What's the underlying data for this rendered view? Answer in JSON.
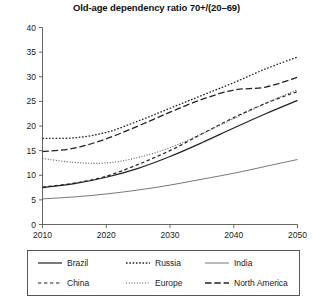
{
  "chart_data": {
    "type": "line",
    "title": "Old-age dependency ratio 70+/(20–69)",
    "xlabel": "",
    "ylabel": "",
    "xlim": [
      2010,
      2050
    ],
    "ylim": [
      0,
      40
    ],
    "xticks": [
      2010,
      2020,
      2030,
      2040,
      2050
    ],
    "yticks": [
      0,
      5,
      10,
      15,
      20,
      25,
      30,
      35,
      40
    ],
    "grid": false,
    "legend_position": "bottom",
    "x": [
      2010,
      2015,
      2020,
      2025,
      2030,
      2035,
      2040,
      2045,
      2050
    ],
    "series": [
      {
        "name": "Brazil",
        "style": "solid",
        "color": "#222222",
        "width": 1.2,
        "values": [
          7.5,
          8.3,
          9.6,
          11.4,
          13.8,
          16.6,
          19.6,
          22.5,
          25.2
        ]
      },
      {
        "name": "Russia",
        "style": "dotted",
        "color": "#222222",
        "width": 1.3,
        "values": [
          17.5,
          17.6,
          18.7,
          21.0,
          23.6,
          26.2,
          28.8,
          31.6,
          34.0
        ]
      },
      {
        "name": "India",
        "style": "solid-thin",
        "color": "#555555",
        "width": 0.8,
        "values": [
          5.2,
          5.6,
          6.2,
          7.0,
          8.0,
          9.2,
          10.4,
          11.8,
          13.2
        ]
      },
      {
        "name": "China",
        "style": "dashed",
        "color": "#222222",
        "width": 1.2,
        "values": [
          7.6,
          8.4,
          9.8,
          12.2,
          15.0,
          18.4,
          21.7,
          24.6,
          27.0
        ]
      },
      {
        "name": "Europe",
        "style": "fine-dotted",
        "color": "#666666",
        "width": 1.1,
        "values": [
          13.4,
          12.6,
          12.5,
          13.6,
          15.6,
          18.4,
          21.5,
          24.6,
          27.4
        ]
      },
      {
        "name": "North America",
        "style": "long-dash",
        "color": "#222222",
        "width": 1.3,
        "values": [
          14.8,
          15.5,
          17.4,
          20.0,
          22.8,
          25.4,
          27.3,
          27.9,
          29.9
        ]
      }
    ]
  },
  "legend": {
    "items": [
      {
        "label": "Brazil"
      },
      {
        "label": "Russia"
      },
      {
        "label": "India"
      },
      {
        "label": "China"
      },
      {
        "label": "Europe"
      },
      {
        "label": "North America"
      }
    ]
  },
  "axis": {
    "y_tick_labels": [
      "0",
      "5",
      "10",
      "15",
      "20",
      "25",
      "30",
      "35",
      "40"
    ],
    "x_tick_labels": [
      "2010",
      "2020",
      "2030",
      "2040",
      "2050"
    ]
  }
}
